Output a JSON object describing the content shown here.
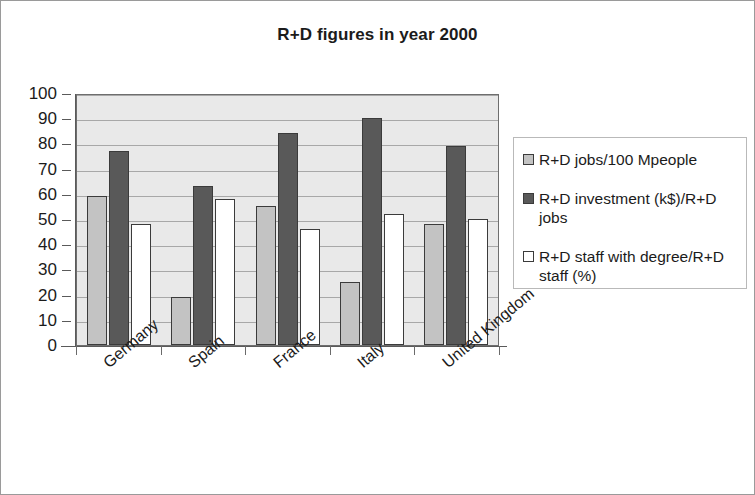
{
  "chart_data": {
    "type": "bar",
    "title": "R+D figures in year 2000",
    "xlabel": "",
    "ylabel": "",
    "ylim": [
      0,
      100
    ],
    "yticks": [
      100,
      90,
      80,
      70,
      60,
      50,
      40,
      30,
      20,
      10,
      0
    ],
    "grid": true,
    "legend_position": "right",
    "categories": [
      "Germany",
      "Spain",
      "France",
      "Italy",
      "United Kingdom"
    ],
    "series": [
      {
        "name": "R+D jobs/100 Mpeople",
        "color": "#c3c3c3",
        "values": [
          59,
          19,
          55,
          25,
          48
        ]
      },
      {
        "name": "R+D investment (k$)/R+D jobs",
        "color": "#595959",
        "values": [
          77,
          63,
          84,
          90,
          79
        ]
      },
      {
        "name": "R+D staff with degree/R+D staff (%)",
        "color": "#ffffff",
        "values": [
          48,
          58,
          46,
          52,
          50
        ]
      }
    ]
  },
  "legend": {
    "items": [
      {
        "label": "R+D jobs/100 Mpeople"
      },
      {
        "label": "R+D investment (k$)/R+D jobs"
      },
      {
        "label": "R+D staff with degree/R+D staff (%)"
      }
    ]
  }
}
